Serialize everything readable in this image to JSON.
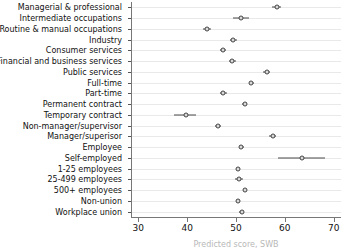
{
  "chart_data": {
    "type": "scatter",
    "title": "",
    "subtitle": "",
    "xlabel": "Predicted score, SWB",
    "ylabel": "",
    "xlim": [
      28.5,
      71.5
    ],
    "xticks": [
      30,
      40,
      50,
      60,
      70
    ],
    "xticklabels": [
      "30",
      "40",
      "50",
      "60",
      "70"
    ],
    "grid": true,
    "grid_axis": "y",
    "legend": "none",
    "orientation": "horizontal",
    "marker": "open-circle-with-dot",
    "error_bars": "horizontal confidence intervals",
    "categories": [
      "Managerial & professional",
      "Intermediate occupations",
      "Routine & manual occupations",
      "Industry",
      "Consumer services",
      "Financial and business services",
      "Public services",
      "Full-time",
      "Part-time",
      "Permanent contract",
      "Temporary contract",
      "Non-manager/supervisor",
      "Manager/superisor",
      "Employee",
      "Self-employed",
      "1-25 employees",
      "25-499 employees",
      "500+ employees",
      "Non-union",
      "Workplace union"
    ],
    "values": [
      58.3,
      51.0,
      44.0,
      49.4,
      47.4,
      49.2,
      56.3,
      53.1,
      47.4,
      51.8,
      39.7,
      46.4,
      57.5,
      51.1,
      63.5,
      50.5,
      50.6,
      51.8,
      50.4,
      51.2
    ],
    "ci_low": [
      57.3,
      49.4,
      43.2,
      48.7,
      46.8,
      48.5,
      55.6,
      52.6,
      46.7,
      51.3,
      37.4,
      45.8,
      56.8,
      50.7,
      58.7,
      50.1,
      49.8,
      51.4,
      50.0,
      50.7
    ],
    "ci_high": [
      59.3,
      52.6,
      44.8,
      50.2,
      48.0,
      50.0,
      57.0,
      53.7,
      48.1,
      52.3,
      41.9,
      47.0,
      58.2,
      51.6,
      68.3,
      50.9,
      51.4,
      52.2,
      50.9,
      51.7
    ],
    "colors": {
      "marker_edge": "#3a3a3a",
      "marker_face": "#ffffff",
      "ci_line": "#4a4a4a",
      "gridline": "#e9e9e9",
      "axis": "#777777",
      "text": "#111111"
    }
  }
}
